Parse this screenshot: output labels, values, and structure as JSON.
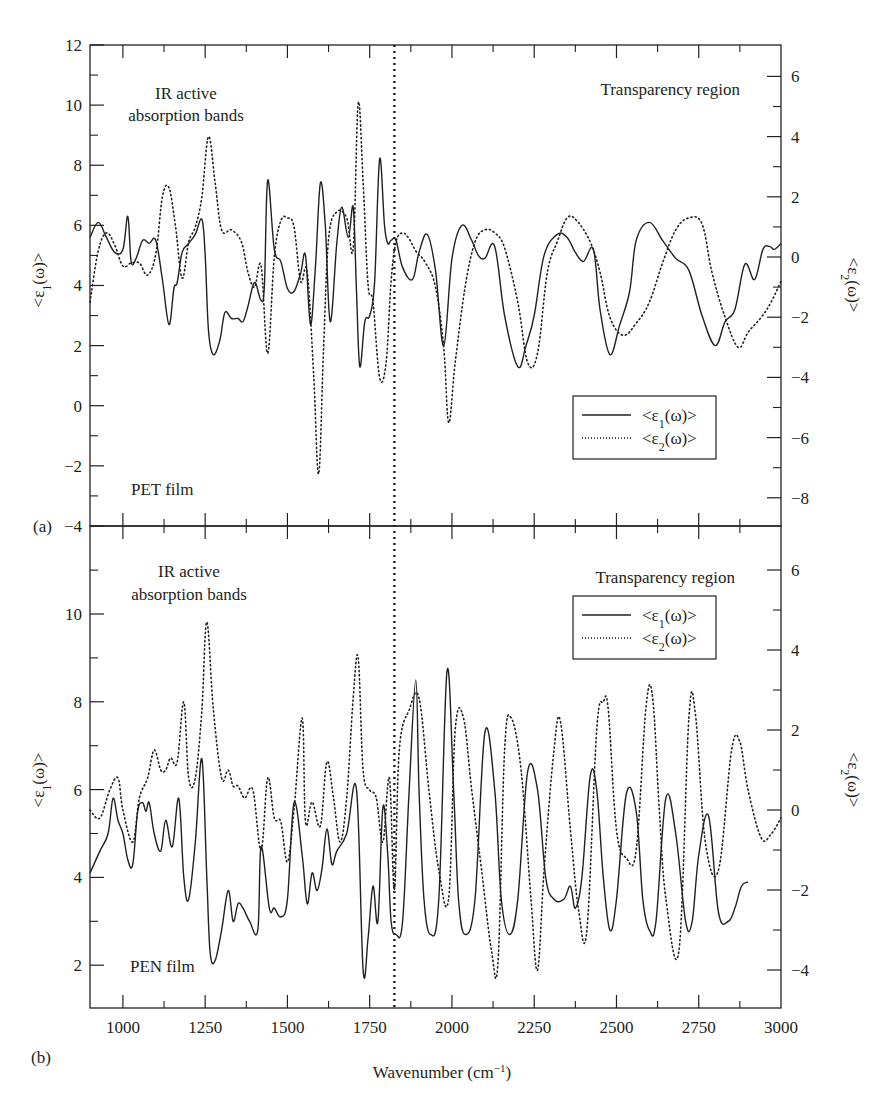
{
  "figure": {
    "panel_a_label": "(a)",
    "panel_b_label": "(b)",
    "xlabel": "Wavenumber (cm",
    "xlabel_sup": "−1",
    "xlabel_close": ")",
    "left_ylabel": "<ε1(ω)>",
    "right_ylabel": "<ε2(ω)>",
    "legend": {
      "series1": "<ε1(ω)>",
      "series2": "<ε2(ω)>"
    },
    "panel_a": {
      "annot_ir_line1": "IR active",
      "annot_ir_line2": "absorption bands",
      "annot_transparency": "Transparency region",
      "film_label": "PET film"
    },
    "panel_b": {
      "annot_ir_line1": "IR active",
      "annot_ir_line2": "absorption bands",
      "annot_transparency": "Transparency region",
      "film_label": "PEN film"
    },
    "divider_wavenumber": 1825
  },
  "chart_data": [
    {
      "type": "line",
      "panel": "(a)",
      "title": "PET film",
      "xlabel": "Wavenumber (cm^-1)",
      "ylabel": "<ε1(ω)>",
      "ylabel_right": "<ε2(ω)>",
      "xlim": [
        900,
        3000
      ],
      "ylim": [
        -4,
        12
      ],
      "ylim_right": [
        -9,
        7
      ],
      "yticks": [
        -4,
        -2,
        0,
        2,
        4,
        6,
        8,
        10,
        12
      ],
      "yticks_right": [
        -8,
        -6,
        -4,
        -2,
        0,
        2,
        4,
        6
      ],
      "xticks": [
        1000,
        1250,
        1500,
        1750,
        2000,
        2250,
        2500,
        2750,
        3000
      ],
      "annotations": [
        "IR active absorption bands",
        "Transparency region",
        "PET film",
        "vertical dotted line at ~1825 cm^-1"
      ],
      "legend_position": "right-middle",
      "series": [
        {
          "name": "<ε1(ω)>",
          "style": "solid",
          "axis": "left",
          "x": [
            900,
            925,
            950,
            975,
            1000,
            1015,
            1025,
            1040,
            1060,
            1080,
            1100,
            1120,
            1140,
            1155,
            1165,
            1180,
            1200,
            1220,
            1240,
            1250,
            1260,
            1275,
            1295,
            1310,
            1330,
            1350,
            1365,
            1380,
            1400,
            1420,
            1430,
            1440,
            1460,
            1480,
            1500,
            1520,
            1540,
            1555,
            1570,
            1585,
            1600,
            1615,
            1630,
            1650,
            1665,
            1685,
            1700,
            1710,
            1720,
            1735,
            1750,
            1765,
            1780,
            1795,
            1805,
            1815,
            1830,
            1850,
            1880,
            1900,
            1925,
            1950,
            1975,
            2000,
            2030,
            2060,
            2080,
            2100,
            2130,
            2160,
            2200,
            2225,
            2250,
            2280,
            2320,
            2350,
            2375,
            2400,
            2430,
            2450,
            2480,
            2510,
            2540,
            2560,
            2600,
            2640,
            2680,
            2720,
            2760,
            2800,
            2830,
            2860,
            2890,
            2920,
            2945,
            2965,
            2980,
            3000
          ],
          "values": [
            5.6,
            6.1,
            5.6,
            5.1,
            5.2,
            6.3,
            4.8,
            4.9,
            5.5,
            5.4,
            5.5,
            4.2,
            2.7,
            3.9,
            4.1,
            5.1,
            5.4,
            5.7,
            6.2,
            5.0,
            2.5,
            1.7,
            2.2,
            3.1,
            2.9,
            2.9,
            2.8,
            3.3,
            4.1,
            3.5,
            4.0,
            7.5,
            5.2,
            4.8,
            3.9,
            3.8,
            4.4,
            5.0,
            2.7,
            4.6,
            7.4,
            6.0,
            2.8,
            5.4,
            6.6,
            5.6,
            6.6,
            3.8,
            1.3,
            2.8,
            3.0,
            4.1,
            8.2,
            6.0,
            5.4,
            5.5,
            5.5,
            4.6,
            4.2,
            5.1,
            5.7,
            4.5,
            2.0,
            4.9,
            6.0,
            5.5,
            5.0,
            4.9,
            5.3,
            3.0,
            1.3,
            2.0,
            3.0,
            5.0,
            5.7,
            5.6,
            5.1,
            4.8,
            5.2,
            3.2,
            1.7,
            2.7,
            3.8,
            5.5,
            6.1,
            5.5,
            4.9,
            4.5,
            3.0,
            2.0,
            2.8,
            3.2,
            4.7,
            4.2,
            5.2,
            5.3,
            5.2,
            5.4
          ],
          "note": "x grid is approximate, values read off figure"
        },
        {
          "name": "<ε2(ω)>",
          "style": "dotted",
          "axis": "right",
          "x": [
            900,
            925,
            950,
            975,
            1000,
            1025,
            1050,
            1075,
            1100,
            1120,
            1140,
            1160,
            1180,
            1200,
            1220,
            1240,
            1260,
            1280,
            1300,
            1330,
            1360,
            1380,
            1400,
            1420,
            1440,
            1460,
            1480,
            1500,
            1520,
            1540,
            1560,
            1580,
            1595,
            1610,
            1625,
            1650,
            1680,
            1700,
            1715,
            1730,
            1745,
            1760,
            1780,
            1800,
            1815,
            1830,
            1850,
            1870,
            1890,
            1920,
            1950,
            1975,
            1990,
            2010,
            2040,
            2070,
            2100,
            2130,
            2160,
            2200,
            2230,
            2260,
            2290,
            2320,
            2350,
            2380,
            2420,
            2450,
            2480,
            2520,
            2560,
            2600,
            2640,
            2680,
            2720,
            2760,
            2790,
            2830,
            2870,
            2900,
            2940,
            2970,
            3000
          ],
          "values": [
            -1.5,
            0.2,
            0.8,
            0.4,
            -0.3,
            -0.2,
            -0.2,
            -0.6,
            0.1,
            2.0,
            2.3,
            1.0,
            -0.7,
            0.5,
            1.0,
            2.0,
            4.0,
            2.5,
            0.9,
            0.9,
            0.5,
            -0.5,
            -1.0,
            -0.3,
            -3.2,
            0.0,
            1.2,
            1.3,
            1.0,
            -0.8,
            -0.5,
            -4.0,
            -7.2,
            -3.0,
            0.6,
            1.5,
            1.3,
            0.3,
            5.1,
            2.5,
            -0.9,
            -1.5,
            -4.0,
            -3.5,
            -0.8,
            0.5,
            0.8,
            0.6,
            0.2,
            -0.2,
            -1.0,
            -3.0,
            -5.5,
            -3.5,
            -1.0,
            0.5,
            0.9,
            0.8,
            0.3,
            -1.5,
            -3.5,
            -3.2,
            -0.5,
            0.5,
            1.3,
            1.2,
            0.5,
            -0.5,
            -2.0,
            -2.6,
            -2.2,
            -1.5,
            -0.2,
            0.9,
            1.3,
            1.1,
            -0.5,
            -2.0,
            -3.0,
            -2.5,
            -2.0,
            -1.5,
            -0.8
          ]
        }
      ]
    },
    {
      "type": "line",
      "panel": "(b)",
      "title": "PEN film",
      "xlabel": "Wavenumber (cm^-1)",
      "ylabel": "<ε1(ω)>",
      "ylabel_right": "<ε2(ω)>",
      "xlim": [
        900,
        3000
      ],
      "ylim": [
        1,
        12
      ],
      "ylim_right": [
        -5,
        7
      ],
      "yticks": [
        2,
        4,
        6,
        8,
        10
      ],
      "yticks_right": [
        -4,
        -2,
        0,
        2,
        4,
        6
      ],
      "xticks": [
        1000,
        1250,
        1500,
        1750,
        2000,
        2250,
        2500,
        2750,
        3000
      ],
      "annotations": [
        "IR active absorption bands",
        "Transparency region",
        "PEN film",
        "vertical dotted line at ~1825 cm^-1"
      ],
      "legend_position": "upper-right",
      "series": [
        {
          "name": "<ε1(ω)>",
          "style": "solid",
          "axis": "left",
          "x": [
            900,
            930,
            955,
            970,
            985,
            1000,
            1015,
            1030,
            1045,
            1060,
            1070,
            1080,
            1095,
            1115,
            1130,
            1150,
            1170,
            1185,
            1200,
            1220,
            1240,
            1255,
            1265,
            1280,
            1300,
            1320,
            1335,
            1350,
            1365,
            1385,
            1410,
            1420,
            1445,
            1460,
            1480,
            1500,
            1520,
            1545,
            1560,
            1575,
            1590,
            1605,
            1620,
            1635,
            1650,
            1680,
            1710,
            1730,
            1745,
            1760,
            1775,
            1790,
            1805,
            1815,
            1830,
            1850,
            1870,
            1890,
            1900,
            1915,
            1935,
            1960,
            1985,
            2005,
            2020,
            2040,
            2070,
            2100,
            2130,
            2150,
            2175,
            2200,
            2230,
            2260,
            2285,
            2310,
            2340,
            2360,
            2375,
            2395,
            2420,
            2440,
            2460,
            2480,
            2500,
            2530,
            2560,
            2580,
            2600,
            2620,
            2650,
            2680,
            2710,
            2730,
            2750,
            2780,
            2810,
            2840,
            2860,
            2880,
            2900,
            2930,
            2960,
            2980,
            3000
          ],
          "values": [
            4.1,
            4.6,
            5.0,
            5.8,
            5.3,
            5.0,
            4.4,
            4.3,
            5.5,
            5.7,
            5.5,
            5.7,
            5.0,
            4.6,
            5.3,
            4.7,
            5.8,
            4.0,
            3.5,
            4.8,
            6.7,
            4.0,
            2.3,
            2.1,
            2.8,
            3.7,
            3.0,
            3.4,
            3.3,
            3.0,
            2.8,
            4.7,
            3.3,
            3.3,
            3.1,
            3.5,
            5.7,
            4.5,
            3.4,
            4.1,
            3.7,
            4.2,
            5.1,
            4.3,
            4.6,
            5.0,
            6.0,
            1.9,
            2.6,
            3.8,
            3.0,
            5.6,
            4.5,
            3.0,
            2.7,
            3.0,
            6.0,
            8.5,
            6.0,
            3.5,
            2.7,
            3.5,
            8.7,
            6.0,
            3.5,
            2.7,
            3.5,
            7.3,
            6.0,
            3.5,
            2.7,
            3.5,
            6.4,
            6.0,
            4.0,
            3.5,
            3.5,
            3.8,
            3.3,
            4.0,
            6.3,
            6.0,
            4.0,
            2.8,
            3.5,
            5.9,
            5.5,
            3.5,
            2.8,
            3.0,
            5.8,
            5.0,
            3.0,
            3.0,
            4.5,
            5.4,
            3.2,
            3.0,
            3.3,
            3.8,
            3.9,
            4.0
          ],
          "note": "x grid is approximate, values read off figure"
        },
        {
          "name": "<ε2(ω)>",
          "style": "dotted",
          "axis": "right",
          "x": [
            900,
            930,
            960,
            985,
            1000,
            1030,
            1050,
            1075,
            1095,
            1115,
            1130,
            1145,
            1165,
            1185,
            1200,
            1220,
            1240,
            1255,
            1275,
            1300,
            1320,
            1335,
            1350,
            1370,
            1395,
            1420,
            1440,
            1460,
            1480,
            1500,
            1520,
            1545,
            1555,
            1575,
            1600,
            1620,
            1640,
            1660,
            1680,
            1700,
            1715,
            1730,
            1750,
            1770,
            1790,
            1810,
            1825,
            1840,
            1870,
            1900,
            1930,
            1960,
            1990,
            2010,
            2035,
            2060,
            2090,
            2120,
            2140,
            2160,
            2180,
            2210,
            2240,
            2260,
            2280,
            2310,
            2330,
            2360,
            2385,
            2410,
            2440,
            2460,
            2475,
            2500,
            2530,
            2560,
            2590,
            2610,
            2630,
            2650,
            2690,
            2720,
            2740,
            2770,
            2810,
            2850,
            2875,
            2900,
            2940,
            2970,
            3000
          ],
          "values": [
            0.0,
            -0.2,
            0.5,
            0.8,
            0.0,
            -0.8,
            0.3,
            0.8,
            1.5,
            1.0,
            1.0,
            1.3,
            1.2,
            2.7,
            0.8,
            0.8,
            2.5,
            4.7,
            2.5,
            0.8,
            1.0,
            0.6,
            0.6,
            0.3,
            0.5,
            -1.0,
            0.8,
            -0.2,
            -0.3,
            -1.3,
            0.0,
            2.3,
            -0.3,
            0.2,
            -0.4,
            1.2,
            0.3,
            -0.8,
            0.3,
            2.8,
            3.8,
            1.0,
            0.5,
            0.3,
            -0.8,
            0.8,
            -2.0,
            1.5,
            2.5,
            2.8,
            0.5,
            -1.5,
            -2.2,
            2.0,
            2.3,
            0.5,
            -1.5,
            -3.5,
            -3.8,
            1.5,
            2.3,
            1.0,
            -2.2,
            -4.0,
            -1.5,
            1.5,
            2.2,
            -0.5,
            -2.5,
            -3.0,
            2.0,
            2.7,
            2.5,
            -0.5,
            -1.2,
            -1.0,
            2.6,
            2.8,
            0.0,
            -2.2,
            -3.5,
            2.3,
            2.4,
            -0.8,
            -1.5,
            1.5,
            1.7,
            0.5,
            -0.7,
            -0.6,
            -0.2
          ]
        }
      ]
    }
  ]
}
